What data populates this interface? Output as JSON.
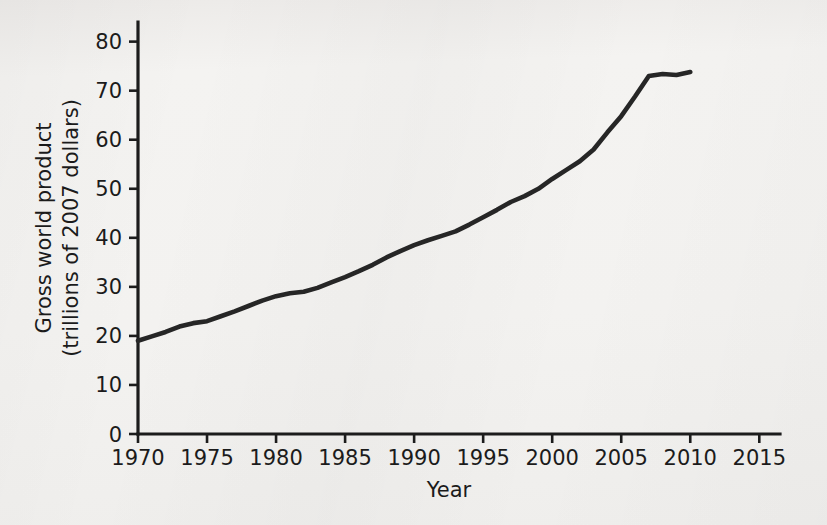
{
  "chart_data": {
    "type": "line",
    "title": "",
    "xlabel": "Year",
    "ylabel": "Gross world product\n(trillions of 2007 dollars)",
    "ylabel_line1": "Gross world product",
    "ylabel_line2": "(trillions of 2007 dollars)",
    "xlim": [
      1970,
      2016.5
    ],
    "ylim": [
      0,
      84
    ],
    "xticks": [
      1970,
      1975,
      1980,
      1985,
      1990,
      1995,
      2000,
      2005,
      2010,
      2015
    ],
    "xtick_labels": [
      "1970",
      "1975",
      "1980",
      "1985",
      "1990",
      "1995",
      "2000",
      "2005",
      "2010",
      "2015"
    ],
    "yticks": [
      0,
      10,
      20,
      30,
      40,
      50,
      60,
      70,
      80
    ],
    "ytick_labels": [
      "0",
      "10",
      "20",
      "30",
      "40",
      "50",
      "60",
      "70",
      "80"
    ],
    "grid": false,
    "legend": false,
    "legend_position": "none",
    "series": [
      {
        "name": "Gross world product",
        "color": "#262626",
        "x": [
          1970,
          1971,
          1972,
          1973,
          1974,
          1975,
          1976,
          1977,
          1978,
          1979,
          1980,
          1981,
          1982,
          1983,
          1984,
          1985,
          1986,
          1987,
          1988,
          1989,
          1990,
          1991,
          1992,
          1993,
          1994,
          1995,
          1996,
          1997,
          1998,
          1999,
          2000,
          2001,
          2002,
          2003,
          2004,
          2005,
          2006,
          2007,
          2008,
          2009,
          2010
        ],
        "values": [
          19.0,
          19.9,
          20.8,
          21.9,
          22.6,
          23.0,
          24.0,
          25.0,
          26.1,
          27.2,
          28.1,
          28.7,
          29.0,
          29.8,
          30.9,
          32.0,
          33.2,
          34.5,
          36.0,
          37.3,
          38.5,
          39.5,
          40.4,
          41.3,
          42.7,
          44.2,
          45.7,
          47.3,
          48.5,
          50.0,
          52.0,
          53.8,
          55.6,
          58.0,
          61.5,
          64.8,
          68.8,
          73.0,
          73.4,
          73.2,
          73.8
        ]
      }
    ]
  },
  "plot_geometry": {
    "x_pixel_min": 138,
    "x_pixel_max": 780,
    "y_pixel_zero": 434,
    "y_pixel_top": 22,
    "tick_len": 9
  }
}
